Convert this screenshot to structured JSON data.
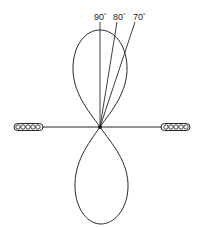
{
  "diagram": {
    "type": "radiation-pattern",
    "angle_labels": [
      {
        "value": "90",
        "unit": "°"
      },
      {
        "value": "80",
        "unit": "°"
      },
      {
        "value": "70",
        "unit": "°"
      }
    ],
    "elements": {
      "left_insulator": "insulator",
      "right_insulator": "insulator",
      "antenna_wire": "horizontal wire",
      "upper_lobe": "upper radiation lobe",
      "lower_lobe": "lower radiation lobe"
    },
    "stroke_color": "#2a2a2a",
    "background": "#ffffff"
  }
}
